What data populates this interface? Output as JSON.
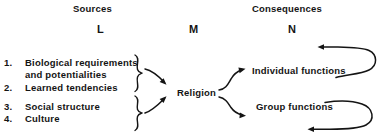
{
  "diagram": {
    "background_color": "#ffffff",
    "ink_color": "#141414",
    "columns": [
      {
        "heading": "Sources",
        "letter": "L"
      },
      {
        "heading": "",
        "letter": "M"
      },
      {
        "heading": "Consequences",
        "letter": "N"
      }
    ],
    "headings": {
      "sources": "Sources",
      "consequences": "Consequences"
    },
    "letters": {
      "left": "L",
      "middle": "M",
      "right": "N"
    },
    "sources": [
      {
        "number": "1.",
        "line1": "Biological requirements",
        "line2": "and potentialities"
      },
      {
        "number": "2.",
        "line1": "Learned tendencies",
        "line2": ""
      },
      {
        "number": "3.",
        "line1": "Social structure",
        "line2": ""
      },
      {
        "number": "4.",
        "line1": "Culture",
        "line2": ""
      }
    ],
    "center_node": "Religion",
    "consequences": [
      {
        "label": "Individual functions"
      },
      {
        "label": "Group functions"
      }
    ],
    "connectors": {
      "brace_upper": "brace-group-1-2",
      "brace_lower": "brace-group-3-4",
      "arrow_upper_to_center": "arrow-sources-1-2-to-religion",
      "arrow_lower_to_center": "arrow-sources-3-4-to-religion",
      "arrow_center_to_individual": "arrow-religion-to-individual-functions",
      "arrow_center_to_group": "arrow-religion-to-group-functions",
      "feedback_individual": "feedback-loop-individual-functions",
      "feedback_group": "feedback-loop-group-functions"
    }
  }
}
